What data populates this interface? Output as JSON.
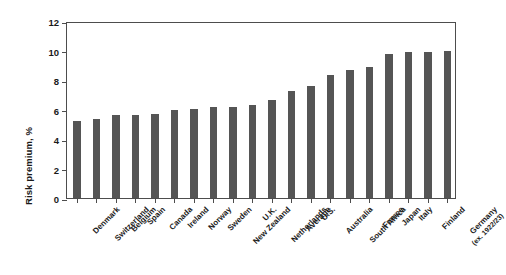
{
  "chart_data": {
    "type": "bar",
    "title": "",
    "subtitle": "",
    "xlabel": "",
    "ylabel": "Risk premium, %",
    "ylim": [
      0,
      12
    ],
    "yticks": [
      0,
      2,
      4,
      6,
      8,
      10,
      12
    ],
    "ytick_labels": [
      "0",
      "2",
      "4",
      "6",
      "8",
      "10",
      "12"
    ],
    "grid": false,
    "legend": null,
    "bar_color": "#555555",
    "axis_color": "#4d4d4d",
    "background_color": "#ffffff",
    "categories": [
      "Denmark",
      "Switzerland",
      "Belgium",
      "Spain",
      "Canada",
      "Ireland",
      "Norway",
      "Sweden",
      "New Zealand",
      "U.K.",
      "Netherlands",
      "Average",
      "U.S.",
      "Australia",
      "South Africa",
      "France",
      "Japan",
      "Italy",
      "Finland",
      "Germany"
    ],
    "category_sublabels": [
      "",
      "",
      "",
      "",
      "",
      "",
      "",
      "",
      "",
      "",
      "",
      "",
      "",
      "",
      "",
      "",
      "",
      "",
      "",
      "(ex. 1922/23)"
    ],
    "values": [
      5.2,
      5.35,
      5.6,
      5.6,
      5.7,
      6.0,
      6.05,
      6.15,
      6.2,
      6.3,
      6.65,
      7.25,
      7.6,
      8.35,
      8.65,
      8.9,
      9.75,
      9.9,
      9.9,
      9.95
    ]
  }
}
